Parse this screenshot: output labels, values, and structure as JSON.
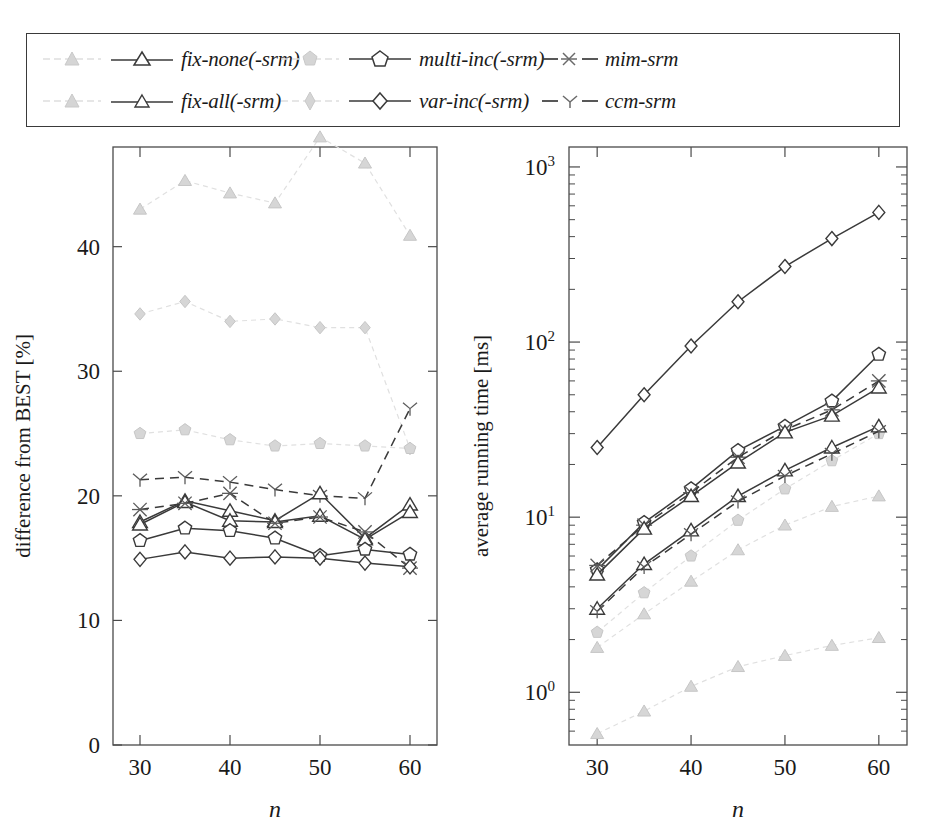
{
  "legend": {
    "entries": [
      {
        "id": "fix-none",
        "label": "fix-none(-srm)",
        "marker": "triangle",
        "style": "solid",
        "tone": "dark",
        "has_faint_pair": true
      },
      {
        "id": "multi-inc",
        "label": "multi-inc(-srm)",
        "marker": "pentagon",
        "style": "solid",
        "tone": "dark",
        "has_faint_pair": true
      },
      {
        "id": "mim-srm",
        "label": "mim-srm",
        "marker": "asterisk",
        "style": "dashed",
        "tone": "dark",
        "has_faint_pair": false
      },
      {
        "id": "fix-all",
        "label": "fix-all(-srm)",
        "marker": "triangle",
        "style": "solid",
        "tone": "dark",
        "has_faint_pair": true
      },
      {
        "id": "var-inc",
        "label": "var-inc(-srm)",
        "marker": "diamond",
        "style": "solid",
        "tone": "dark",
        "has_faint_pair": true
      },
      {
        "id": "ccm-srm",
        "label": "ccm-srm",
        "marker": "ystar",
        "style": "dashed",
        "tone": "dark",
        "has_faint_pair": false
      }
    ]
  },
  "colors": {
    "dark": "#3a3a3a",
    "faint": "#d9d9d9",
    "frame": "#4a4a4a",
    "text": "#1a1a1a"
  },
  "chart_data": [
    {
      "type": "line",
      "id": "left-chart",
      "title": "",
      "xlabel": "n",
      "ylabel": "difference from BEST [%]",
      "x": [
        30,
        35,
        40,
        45,
        50,
        55,
        60
      ],
      "xlim": [
        27,
        63
      ],
      "ylim": [
        0,
        48
      ],
      "xticks": [
        30,
        40,
        50,
        60
      ],
      "xticks_minor": [
        35,
        45,
        55
      ],
      "yticks": [
        0,
        10,
        20,
        30,
        40
      ],
      "yscale": "linear",
      "grid": false,
      "legend_position": "top-external",
      "series": [
        {
          "name": "fix-none",
          "tone": "faint",
          "marker": "triangle",
          "style": "solid",
          "values": [
            43.0,
            45.3,
            44.3,
            43.5,
            48.8,
            46.7,
            40.9
          ]
        },
        {
          "name": "fix-all",
          "tone": "faint",
          "marker": "diamondthin",
          "style": "solid",
          "values": [
            34.6,
            35.6,
            34.0,
            34.2,
            33.5,
            33.5,
            23.8
          ]
        },
        {
          "name": "multi-inc",
          "tone": "faint",
          "marker": "pentagonthin",
          "style": "solid",
          "values": [
            25.0,
            25.3,
            24.5,
            24.0,
            24.2,
            24.0,
            23.8
          ]
        },
        {
          "name": "ccm-srm",
          "tone": "dark",
          "marker": "ystar",
          "style": "dashed",
          "values": [
            21.3,
            21.5,
            21.1,
            20.5,
            20.0,
            19.8,
            27.0
          ]
        },
        {
          "name": "fix-none-srm",
          "tone": "dark",
          "marker": "triangle",
          "style": "solid",
          "values": [
            17.9,
            19.6,
            18.8,
            18.0,
            20.2,
            16.6,
            19.3
          ]
        },
        {
          "name": "fix-all-srm",
          "tone": "dark",
          "marker": "triangle",
          "style": "solid",
          "values": [
            17.7,
            19.5,
            18.0,
            17.9,
            18.4,
            16.5,
            18.7
          ]
        },
        {
          "name": "mim-srm",
          "tone": "dark",
          "marker": "asterisk",
          "style": "dashed",
          "values": [
            18.9,
            19.4,
            20.2,
            17.8,
            18.3,
            17.1,
            14.2
          ]
        },
        {
          "name": "multi-inc-srm",
          "tone": "dark",
          "marker": "pentagon",
          "style": "solid",
          "values": [
            16.4,
            17.4,
            17.2,
            16.6,
            15.2,
            15.7,
            15.3
          ]
        },
        {
          "name": "var-inc-srm",
          "tone": "dark",
          "marker": "diamond",
          "style": "solid",
          "values": [
            14.9,
            15.5,
            15.0,
            15.1,
            15.0,
            14.6,
            14.3
          ]
        }
      ]
    },
    {
      "type": "line",
      "id": "right-chart",
      "title": "",
      "xlabel": "n",
      "ylabel": "average running time [ms]",
      "x": [
        30,
        35,
        40,
        45,
        50,
        55,
        60
      ],
      "xlim": [
        27,
        63
      ],
      "ylim": [
        0.5,
        1300
      ],
      "xticks": [
        30,
        40,
        50,
        60
      ],
      "xticks_minor": [
        35,
        45,
        55
      ],
      "yticks": [
        1,
        10,
        100,
        1000
      ],
      "ytick_labels": [
        "10^0",
        "10^1",
        "10^2",
        "10^3"
      ],
      "yscale": "log",
      "grid": false,
      "legend_position": "top-external",
      "series": [
        {
          "name": "var-inc-srm",
          "tone": "dark",
          "marker": "diamond",
          "style": "solid",
          "values": [
            25,
            50,
            95,
            170,
            270,
            390,
            550
          ]
        },
        {
          "name": "multi-inc-srm",
          "tone": "dark",
          "marker": "pentagon",
          "style": "solid",
          "values": [
            5.0,
            9.3,
            14.5,
            24.0,
            33.0,
            46.0,
            85.0
          ]
        },
        {
          "name": "mim-srm",
          "tone": "dark",
          "marker": "asterisk",
          "style": "dashed",
          "values": [
            5.3,
            9.0,
            13.8,
            22.0,
            31.5,
            41.0,
            60.0
          ]
        },
        {
          "name": "fix-none-srm",
          "tone": "dark",
          "marker": "triangle",
          "style": "solid",
          "values": [
            4.7,
            8.6,
            13.2,
            20.5,
            30.5,
            38.0,
            55.0
          ]
        },
        {
          "name": "fix-all-srm",
          "tone": "dark",
          "marker": "triangle",
          "style": "solid",
          "values": [
            3.0,
            5.4,
            8.4,
            13.2,
            18.5,
            25.0,
            33.0
          ]
        },
        {
          "name": "ccm-srm",
          "tone": "dark",
          "marker": "ystar",
          "style": "dashed",
          "values": [
            2.9,
            5.2,
            8.0,
            12.3,
            17.2,
            23.0,
            31.0
          ]
        },
        {
          "name": "multi-inc",
          "tone": "faint",
          "marker": "pentagonthin",
          "style": "solid",
          "values": [
            2.2,
            3.7,
            6.0,
            9.6,
            14.5,
            21.0,
            30.0
          ]
        },
        {
          "name": "fix-all",
          "tone": "faint",
          "marker": "triangle",
          "style": "solid",
          "values": [
            1.8,
            2.8,
            4.3,
            6.5,
            9.0,
            11.5,
            13.2
          ]
        },
        {
          "name": "fix-none",
          "tone": "faint",
          "marker": "triangle",
          "style": "solid",
          "values": [
            0.58,
            0.78,
            1.08,
            1.4,
            1.62,
            1.85,
            2.05
          ]
        }
      ]
    }
  ]
}
